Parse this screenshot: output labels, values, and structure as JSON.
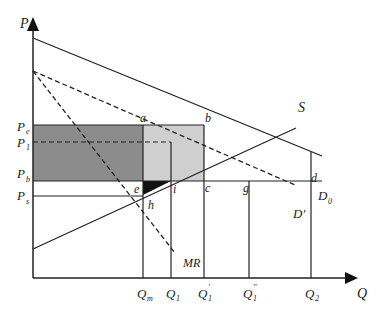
{
  "diagram": {
    "type": "economics-supply-demand",
    "axes": {
      "y_label": "P",
      "x_label": "Q"
    },
    "price_labels": {
      "pe": {
        "main": "P",
        "sub": "e"
      },
      "p1": {
        "main": "P",
        "sub": "1"
      },
      "pb": {
        "main": "P",
        "sub": "b"
      },
      "ps": {
        "main": "P",
        "sub": "s"
      }
    },
    "quantity_labels": {
      "qm": {
        "main": "Q",
        "sub": "m"
      },
      "q1": {
        "main": "Q",
        "sub": "1"
      },
      "q1p": {
        "main": "Q",
        "sub": "1",
        "sup": "'"
      },
      "q1pp": {
        "main": "Q",
        "sub": "1",
        "sup": "''"
      },
      "q2": {
        "main": "Q",
        "sub": "2"
      }
    },
    "curves": {
      "supply": "S",
      "demand0": {
        "main": "D",
        "sub": "0"
      },
      "demand_prime": "D'",
      "marginal_revenue": "MR"
    },
    "points": [
      "a",
      "b",
      "c",
      "d",
      "e",
      "g",
      "h",
      "i"
    ],
    "colors": {
      "dark_fill": "#8c8c8c",
      "light_fill": "#cfcfcf",
      "triangle_fill": "#111111",
      "line": "#222222"
    }
  }
}
